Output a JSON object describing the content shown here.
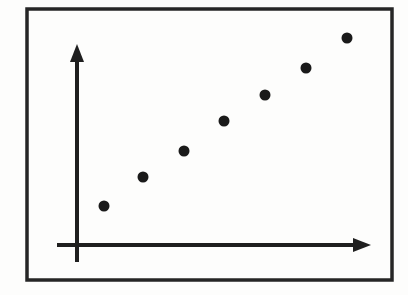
{
  "figure": {
    "title": "",
    "caption": "",
    "kind": "scatter-plot-diagram",
    "background_color": "#fdfdfc",
    "ink_color": "#1a1a1a"
  },
  "frame": {
    "name": "outer-border",
    "x": 27,
    "y": 9,
    "width": 365,
    "height": 271,
    "stroke_color": "#262626",
    "stroke_width": 3.5
  },
  "axes": {
    "stroke_color": "#1f1f1f",
    "stroke_width": 4,
    "origin_x": 77,
    "origin_y": 245,
    "x_axis": {
      "name": "x-axis",
      "label": "",
      "start_x": 57,
      "end_x": 371,
      "y": 245,
      "arrow": "right",
      "ticks": [],
      "tick_labels": []
    },
    "y_axis": {
      "name": "y-axis",
      "label": "",
      "x": 77,
      "start_y": 262,
      "end_y": 44,
      "arrow": "up",
      "ticks": [],
      "tick_labels": []
    },
    "arrowhead": {
      "length": 18,
      "half_width": 7
    }
  },
  "chart_data": {
    "type": "scatter",
    "title": "",
    "subtitle": "",
    "xlabel": "",
    "ylabel": "",
    "xlim": [
      0,
      7
    ],
    "ylim": [
      0,
      7
    ],
    "grid": false,
    "legend": false,
    "legend_position": "none",
    "annotations": [],
    "marker": {
      "shape": "circle",
      "color": "#1a1a1a",
      "diameter_px": 11
    },
    "series": [
      {
        "name": "observations",
        "color": "#1a1a1a",
        "x": [
          1,
          2,
          3,
          4,
          5,
          6,
          7
        ],
        "values": [
          1.0,
          1.85,
          2.7,
          3.65,
          4.55,
          5.45,
          6.4
        ],
        "points_px": [
          {
            "x": 104,
            "y": 206
          },
          {
            "x": 143,
            "y": 177
          },
          {
            "x": 184,
            "y": 151
          },
          {
            "x": 224,
            "y": 121
          },
          {
            "x": 265,
            "y": 95
          },
          {
            "x": 306,
            "y": 68
          },
          {
            "x": 347,
            "y": 38
          }
        ]
      }
    ]
  }
}
